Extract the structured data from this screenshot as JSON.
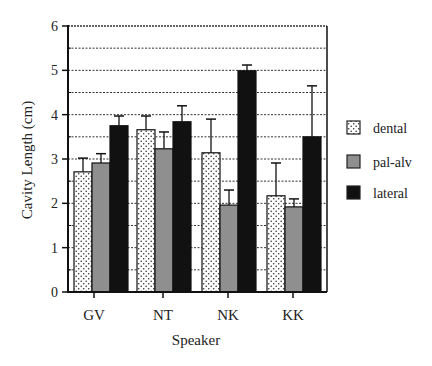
{
  "chart_data": {
    "type": "bar",
    "title": "",
    "xlabel": "Speaker",
    "ylabel": "Cavity Length (cm)",
    "ylim": [
      0,
      6
    ],
    "yticks": [
      0,
      1,
      2,
      3,
      4,
      5,
      6
    ],
    "grid": {
      "on": true,
      "step": 0.5,
      "style": "dotted",
      "axis": "y"
    },
    "legend_position": "right",
    "categories": [
      "GV",
      "NT",
      "NK",
      "KK"
    ],
    "series": [
      {
        "name": "dental",
        "fill": "dotted",
        "color": "#ffffff",
        "values": [
          2.71,
          3.66,
          3.14,
          2.17
        ],
        "error_upper": [
          3.02,
          3.97,
          3.9,
          2.91
        ]
      },
      {
        "name": "pal-alv",
        "fill": "solid",
        "color": "#8f8f8f",
        "values": [
          2.91,
          3.23,
          1.96,
          1.92
        ],
        "error_upper": [
          3.12,
          3.61,
          2.3,
          2.1
        ]
      },
      {
        "name": "lateral",
        "fill": "solid",
        "color": "#111111",
        "values": [
          3.75,
          3.84,
          4.99,
          3.5
        ],
        "error_upper": [
          3.97,
          4.2,
          5.12,
          4.65
        ]
      }
    ]
  }
}
